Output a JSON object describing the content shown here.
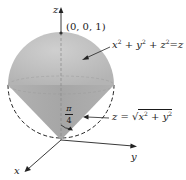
{
  "diagram": {
    "axes": {
      "z_label": "z",
      "y_label": "y",
      "x_label": "x"
    },
    "point_label": "(0, 0, 1)",
    "sphere_equation": {
      "lhs_x": "x",
      "lhs_y": "y",
      "lhs_z": "z",
      "exp": "2",
      "plus": "+",
      "equals": "=",
      "rhs": "z"
    },
    "cone_equation": {
      "lhs": "z",
      "equals": "=",
      "sqrt": "√",
      "x": "x",
      "y": "y",
      "exp": "2",
      "plus": "+"
    },
    "angle_label": {
      "numerator": "π",
      "denominator": "4"
    },
    "colors": {
      "sphere_fill": "#c4c4c4",
      "cone_fill": "#a9a9a9",
      "stroke": "#222222",
      "background": "#ffffff"
    }
  }
}
